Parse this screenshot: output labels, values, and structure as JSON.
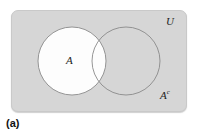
{
  "figure": {
    "caption": "(a)",
    "universe_label": "U",
    "set_a_label": "A",
    "complement_label": "A",
    "complement_superscript": "c",
    "colors": {
      "page_background": "#ffffff",
      "universe_fill": "#d6d6d6",
      "universe_border": "#c9c9c9",
      "set_a_fill": "#ffffff",
      "circle_stroke": "#8a8a8a",
      "label_color": "#1c1c1c"
    },
    "geometry": {
      "universe_rect": {
        "x": 11,
        "y": 10,
        "width": 176,
        "height": 102,
        "corner_radius": 7
      },
      "circle_a": {
        "cx": 72,
        "cy": 61,
        "r": 34
      },
      "circle_b": {
        "cx": 126,
        "cy": 61,
        "r": 34
      }
    },
    "shaded_region_description": "Set A shown white; complement of A shown shaded gray"
  }
}
